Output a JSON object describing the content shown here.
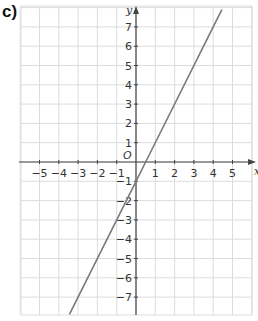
{
  "part_label": "c)",
  "chart_data": {
    "type": "line",
    "title": "",
    "xlabel": "x",
    "ylabel": "y",
    "origin_label": "O",
    "xlim": [
      -5.9,
      6.0
    ],
    "ylim": [
      -7.9,
      8.0
    ],
    "grid": true,
    "x_ticks": [
      "-5",
      "-4",
      "-3",
      "-2",
      "-1",
      "1",
      "2",
      "3",
      "4",
      "5"
    ],
    "y_ticks": [
      "7",
      "6",
      "5",
      "4",
      "3",
      "2",
      "1",
      "-1",
      "-2",
      "-3",
      "-4",
      "-5",
      "-6",
      "-7"
    ],
    "series": [
      {
        "name": "y = 2x - 1",
        "slope": 2,
        "intercept": -1,
        "x": [
          -3.45,
          0,
          0.5,
          4,
          4.45
        ],
        "y": [
          -7.9,
          -1,
          0,
          7,
          7.9
        ]
      }
    ],
    "colors": {
      "line": "#7a7a7a",
      "grid": "#dcdcdc",
      "axis": "#444444"
    }
  }
}
